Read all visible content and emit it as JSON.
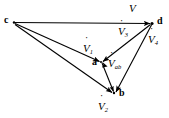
{
  "figure": {
    "background_color": "#ffffff",
    "stroke_color": "#000000",
    "width": 169,
    "height": 118
  },
  "vertices": [
    {
      "id": "c",
      "label": "c",
      "x": 13,
      "y": 22,
      "label_x": 4,
      "label_y": 17
    },
    {
      "id": "d",
      "label": "d",
      "x": 152,
      "y": 23,
      "label_x": 157,
      "label_y": 18
    },
    {
      "id": "a",
      "label": "a",
      "x": 101,
      "y": 62,
      "label_x": 93,
      "label_y": 58
    },
    {
      "id": "b",
      "label": "b",
      "x": 114,
      "y": 93,
      "label_x": 119,
      "label_y": 89
    }
  ],
  "vectors": [
    {
      "id": "V",
      "name": "V-dot",
      "symbol": "V",
      "subscript": "",
      "from": "c",
      "to": "d",
      "label_x": 129,
      "label_y": 2
    },
    {
      "id": "V1",
      "name": "V-dot-1",
      "symbol": "V",
      "subscript": "1",
      "from": "c",
      "to": "a",
      "label_x": 83,
      "label_y": 43
    },
    {
      "id": "V2",
      "name": "V-dot-2",
      "symbol": "V",
      "subscript": "2",
      "from": "c",
      "to": "b",
      "label_x": 99,
      "label_y": 101
    },
    {
      "id": "V3",
      "name": "V-dot-3",
      "symbol": "V",
      "subscript": "3",
      "from": "d",
      "to": "a",
      "label_x": 119,
      "label_y": 25
    },
    {
      "id": "V4",
      "name": "V-dot-4",
      "symbol": "V",
      "subscript": "4",
      "from": "d",
      "to": "b",
      "label_x": 148,
      "label_y": 33
    },
    {
      "id": "Vab",
      "name": "V-dot-ab",
      "symbol": "V",
      "subscript": "ab",
      "from": "a",
      "to": "b",
      "label_x": 108,
      "label_y": 59
    }
  ],
  "labels": {
    "V": {
      "symbol": "V",
      "subscript": ""
    },
    "V1": {
      "symbol": "V",
      "subscript": "1"
    },
    "V2": {
      "symbol": "V",
      "subscript": "2"
    },
    "V3": {
      "symbol": "V",
      "subscript": "3"
    },
    "V4": {
      "symbol": "V",
      "subscript": "4"
    },
    "Vab": {
      "symbol": "V",
      "subscript": "ab"
    },
    "c": "c",
    "d": "d",
    "a": "a",
    "b": "b"
  }
}
